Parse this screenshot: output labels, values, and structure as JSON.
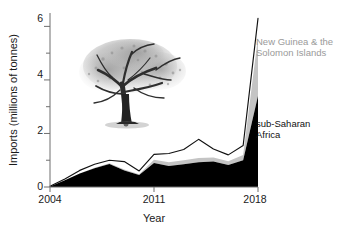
{
  "chart_data": {
    "type": "area",
    "title": "",
    "xlabel": "Year",
    "ylabel": "Imports (millions of tonnes)",
    "xlim": [
      2004,
      2018
    ],
    "ylim": [
      0,
      6.5
    ],
    "xticks": [
      2004,
      2011,
      2018
    ],
    "xticklabels": [
      "2004",
      "2011",
      "2018"
    ],
    "yticks": [
      0,
      2,
      4,
      6
    ],
    "yticklabels": [
      "0",
      "2",
      "4",
      "6"
    ],
    "yminorticks": [
      1,
      3,
      5
    ],
    "grid": false,
    "legend_position": "right-inline",
    "stacked": true,
    "x": [
      2004,
      2005,
      2006,
      2007,
      2008,
      2009,
      2010,
      2011,
      2012,
      2013,
      2014,
      2015,
      2016,
      2017,
      2018
    ],
    "series": [
      {
        "name": "sub-Saharan Africa",
        "color": "#000000",
        "values": [
          0.02,
          0.25,
          0.5,
          0.7,
          0.86,
          0.62,
          0.45,
          0.9,
          0.78,
          0.85,
          0.92,
          0.95,
          0.82,
          1.0,
          3.4
        ]
      },
      {
        "name": "New Guinea & the Solomon Islands",
        "color": "#c4c4c4",
        "values": [
          0.0,
          0.0,
          0.0,
          0.02,
          0.03,
          0.03,
          0.03,
          0.12,
          0.14,
          0.15,
          0.16,
          0.15,
          0.14,
          0.2,
          2.2
        ]
      },
      {
        "name": "total-outline",
        "color": "#000000",
        "values": [
          0.03,
          0.3,
          0.62,
          0.85,
          1.0,
          0.95,
          0.6,
          1.22,
          1.25,
          1.4,
          1.78,
          1.42,
          1.2,
          1.55,
          6.3
        ]
      }
    ]
  },
  "axes": {
    "ylabel": "Imports (millions of tonnes)",
    "xlabel": "Year",
    "ytick_0": "0",
    "ytick_2": "2",
    "ytick_4": "4",
    "ytick_6": "6",
    "xtick_start": "2004",
    "xtick_mid": "2011",
    "xtick_end": "2018"
  },
  "legend": {
    "new_guinea": "New Guinea & the\nSolomon Islands",
    "sub_saharan": "sub-Saharan\nAfrica"
  },
  "illustration": {
    "name": "rosewood-tree-illustration"
  },
  "colors": {
    "sub_saharan_fill": "#000000",
    "new_guinea_fill": "#c4c4c4",
    "total_line": "#111111",
    "axis": "#6f6f6f",
    "text": "#1a1a1a",
    "legend_gray": "#9a9a9a",
    "background": "#ffffff"
  }
}
